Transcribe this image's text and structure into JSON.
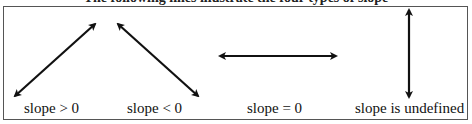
{
  "caption": "The following lines illustrate the four types of slope",
  "panels": [
    {
      "label": "slope > 0",
      "direction": "up-right"
    },
    {
      "label": "slope < 0",
      "direction": "down-right"
    },
    {
      "label": "slope = 0",
      "direction": "horizontal"
    },
    {
      "label": "slope is undefined",
      "direction": "vertical"
    }
  ],
  "colors": {
    "line": "#111111",
    "border": "#555555"
  }
}
